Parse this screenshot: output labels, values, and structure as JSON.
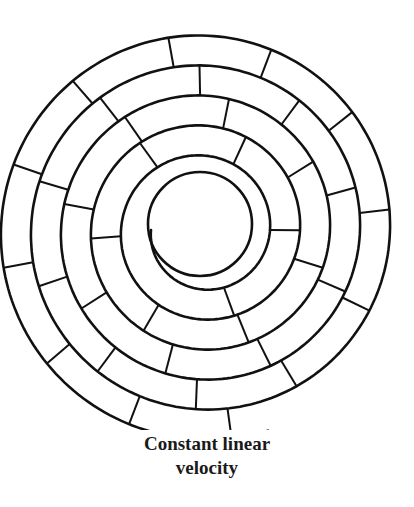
{
  "caption": {
    "line1": "Constant linear",
    "line2": "velocity"
  },
  "diagram": {
    "type": "spiral-track-sectors",
    "stroke_color": "#111111",
    "center": [
      203,
      230
    ],
    "inner_radius": 52,
    "pitch": 30,
    "turns": 5.3,
    "start_angle_deg": 180,
    "sectors_per_turn_approx": "increasing outward (constant linear length)",
    "sector_arc_length": 95
  }
}
